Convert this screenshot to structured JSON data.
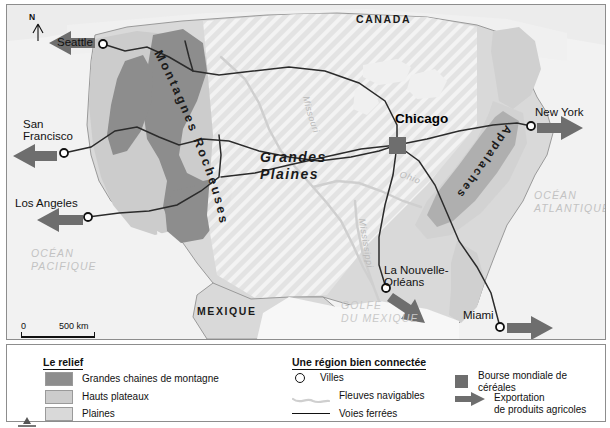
{
  "map": {
    "countries": [
      {
        "name": "CANADA",
        "x": 355,
        "y": 14
      },
      {
        "name": "MEXIQUE",
        "x": 196,
        "y": 306
      }
    ],
    "oceans": [
      {
        "name": "OCÉAN\nPACIFIQUE",
        "x": 30,
        "y": 248
      },
      {
        "name": "OCÉAN\nATLANTIQUE",
        "x": 533,
        "y": 190
      },
      {
        "name": "GOLFE\nDU MEXIQUE",
        "x": 340,
        "y": 300
      }
    ],
    "cities": [
      {
        "name": "Seattle",
        "label_x": 56,
        "label_y": 37,
        "dot_x": 96,
        "dot_y": 39,
        "marker": "circle"
      },
      {
        "name": "San\nFrancisco",
        "label_x": 22,
        "label_y": 119,
        "dot_x": 57,
        "dot_y": 148,
        "marker": "circle"
      },
      {
        "name": "Los Angeles",
        "label_x": 14,
        "label_y": 198,
        "dot_x": 81,
        "dot_y": 212,
        "marker": "circle"
      },
      {
        "name": "Chicago",
        "label_x": 394,
        "label_y": 112,
        "dot_x": 390,
        "dot_y": 140,
        "marker": "square"
      },
      {
        "name": "New York",
        "label_x": 534,
        "label_y": 107,
        "dot_x": 524,
        "dot_y": 121,
        "marker": "circle"
      },
      {
        "name": "La Nouvelle-\nOrléans",
        "label_x": 383,
        "label_y": 265,
        "dot_x": 379,
        "dot_y": 283,
        "marker": "circle"
      },
      {
        "name": "Miami",
        "label_x": 462,
        "label_y": 310,
        "dot_x": 493,
        "dot_y": 322,
        "marker": "circle"
      }
    ],
    "relief_labels": [
      {
        "name": "Montagnes Rocheuses"
      },
      {
        "name": "Appalaches"
      }
    ],
    "region_label": "Grandes\nPlaines",
    "rivers": [
      "Missouri",
      "Mississippi",
      "Ohio"
    ],
    "north_label": "N",
    "scale": {
      "zero": "0",
      "distance": "500 km"
    }
  },
  "legend": {
    "relief": {
      "title": "Le relief",
      "items": [
        {
          "label": "Grandes chaines de montagne",
          "color": "#8d8d8d"
        },
        {
          "label": "Hauts plateaux",
          "color": "#cccccc"
        },
        {
          "label": "Plaines",
          "color": "#d9d9d9"
        }
      ]
    },
    "connected": {
      "title": "Une région bien connectée",
      "items": [
        {
          "label": "Villes",
          "symbol": "circle"
        },
        {
          "label": "Fleuves navigables",
          "symbol": "river"
        },
        {
          "label": "Voies ferrées",
          "symbol": "rail"
        }
      ]
    },
    "trade": {
      "items": [
        {
          "label": "Bourse mondiale de céréales",
          "symbol": "square",
          "color": "#6e6e6e"
        },
        {
          "label": "Exportation\nde produits agricoles",
          "symbol": "arrow",
          "color": "#6e6e6e"
        }
      ]
    }
  },
  "colors": {
    "mountain": "#8d8d8d",
    "plateau": "#cccccc",
    "plain": "#d9d9d9",
    "water": "#f2f2f2",
    "land_light": "#e6e6e6",
    "arrow": "#6e6e6e",
    "line": "#2b2b2b"
  }
}
